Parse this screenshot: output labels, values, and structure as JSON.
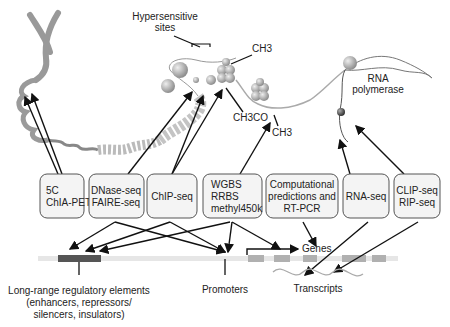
{
  "diagram": {
    "top_labels": {
      "hypersensitive": [
        "Hypersensitive",
        "sites"
      ],
      "ch3_top": "CH3",
      "ch3co": "CH3CO",
      "ch3_bottom": "CH3",
      "rna_polymerase": [
        "RNA",
        "polymerase"
      ]
    },
    "method_boxes": [
      {
        "id": "5c",
        "lines": [
          "5C",
          "ChIA-PET"
        ]
      },
      {
        "id": "dnase",
        "lines": [
          "DNase-seq",
          "FAIRE-seq"
        ]
      },
      {
        "id": "chip",
        "lines": [
          "ChIP-seq"
        ]
      },
      {
        "id": "wgbs",
        "lines": [
          "WGBS",
          "RRBS",
          "methyl450k"
        ]
      },
      {
        "id": "comp",
        "lines": [
          "Computational",
          "predictions and",
          "RT-PCR"
        ]
      },
      {
        "id": "rnaseq",
        "lines": [
          "RNA-seq"
        ]
      },
      {
        "id": "clip",
        "lines": [
          "CLIP-seq",
          "RIP-seq"
        ]
      }
    ],
    "bottom_labels": {
      "long_range": [
        "Long-range regulatory elements",
        "(enhancers, repressors/",
        "silencers, insulators)"
      ],
      "promoters": "Promoters",
      "genes": "Genes",
      "transcripts": "Transcripts"
    },
    "colors": {
      "chromatin": "#a8a8a8",
      "regulatory_bar": "#555555",
      "exon": "#b0b0b0",
      "track": "#e6e6e6"
    }
  }
}
